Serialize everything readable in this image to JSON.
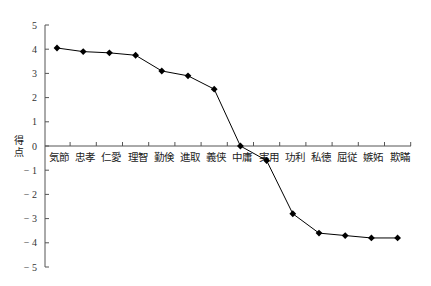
{
  "chart_data": {
    "type": "line",
    "title": "",
    "xlabel": "",
    "ylabel": "得点",
    "ylim": [
      -5,
      5
    ],
    "yticks": [
      5,
      4,
      3,
      2,
      1,
      0,
      -1,
      -2,
      -3,
      -4,
      -5
    ],
    "ytick_labels": [
      "5",
      "4",
      "3",
      "2",
      "1",
      "0",
      "-1",
      "-2",
      "-3",
      "-4",
      "-5"
    ],
    "grid": false,
    "legend": null,
    "marker": "diamond",
    "line_color": "#000000",
    "categories": [
      "気節",
      "忠孝",
      "仁愛",
      "理智",
      "勤倹",
      "進取",
      "義侠",
      "中庸",
      "実用",
      "功利",
      "私徳",
      "屈従",
      "嫉妬",
      "欺瞞"
    ],
    "series": [
      {
        "name": "",
        "values": [
          4.05,
          3.9,
          3.85,
          3.75,
          3.1,
          2.9,
          2.35,
          0.0,
          -0.6,
          -2.8,
          -3.6,
          -3.7,
          -3.8,
          -3.8
        ]
      }
    ]
  }
}
